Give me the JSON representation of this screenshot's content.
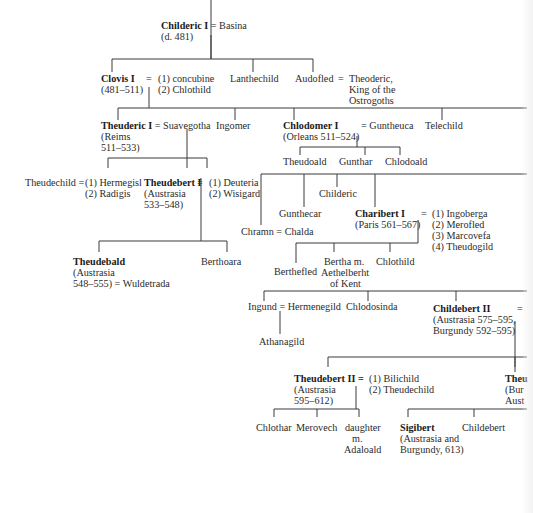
{
  "diagram": {
    "generation_1": {
      "childeric_i": {
        "name": "Childeric I",
        "spouse": "= Basina",
        "dates": "(d. 481)"
      }
    },
    "generation_2": {
      "clovis_i": {
        "name": "Clovis I",
        "dates": "(481–511)",
        "eq": "=",
        "spouses": [
          "(1) concubine",
          "(2) Chlothild"
        ]
      },
      "lanthechild": {
        "name": "Lanthechild"
      },
      "audofled": {
        "name": "Audofled",
        "eq": "=",
        "spouse_lines": [
          "Theoderic,",
          "King of the",
          "Ostrogoths"
        ]
      }
    },
    "generation_3": {
      "theuderic_i": {
        "name": "Theuderic I",
        "spouse": "= Suavegotha",
        "dates": [
          "(Reims",
          "511–533)"
        ]
      },
      "ingomer": {
        "name": "Ingomer"
      },
      "chlodomer_i": {
        "name": "Chlodomer I",
        "spouse": "= Guntheuca",
        "dates": "(Orleans 511–524)"
      },
      "telechild": {
        "name": "Telechild"
      }
    },
    "chlodomer_children": [
      "Theudoald",
      "Gunthar",
      "Chlodoald"
    ],
    "generation_4": {
      "theudechild": {
        "name": "Theudechild =",
        "spouses": [
          "(1) Hermegisl",
          "(2) Radigis"
        ]
      },
      "theudebert_i": {
        "name": "Theudebert I",
        "eq": "=",
        "dates": [
          "(Austrasia",
          "533–548)"
        ],
        "spouses": [
          "(1) Deuteria",
          "(2) Wisigard"
        ]
      },
      "chramn": {
        "name": "Chramn = Chalda"
      },
      "gunthecar": {
        "name": "Gunthecar"
      },
      "childeric": {
        "name": "Childeric"
      },
      "charibert_i": {
        "name": "Charibert I",
        "dates": "(Paris 561–567)",
        "eq": "=",
        "spouses": [
          "(1) Ingoberga",
          "(2) Merofled",
          "(3) Marcovefa",
          "(4) Theudogild"
        ]
      }
    },
    "theudebert_children": {
      "theudebald": {
        "name": "Theudebald",
        "dates": [
          "(Austrasia",
          "548–555) = Wuldetrada"
        ]
      },
      "berthoara": {
        "name": "Berthoara"
      }
    },
    "charibert_children": {
      "berthefled": {
        "name": "Berthefled"
      },
      "bertha": {
        "lines": [
          "Bertha m.",
          "Aethelberht",
          "of Kent"
        ]
      },
      "chlothild": {
        "name": "Chlothild"
      }
    },
    "generation_5": {
      "ingund": {
        "name": "Ingund = Hermenegild"
      },
      "athanagild": {
        "name": "Athanagild"
      },
      "chlodosinda": {
        "name": "Chlodosinda"
      },
      "childebert_ii": {
        "name": "Childebert II",
        "eq": "=",
        "dates": [
          "(Austrasia 575–595,",
          "Burgundy 592–595)"
        ]
      }
    },
    "generation_6": {
      "theudebert_ii": {
        "name": "Theudebert II =",
        "dates": [
          "(Austrasia",
          "595–612)"
        ],
        "spouses": [
          "(1) Bilichild",
          "(2) Theudechild"
        ]
      },
      "theuderic_ii_cut": {
        "name": "Theu",
        "dates": [
          "(Bur",
          "Aust"
        ]
      }
    },
    "generation_7": {
      "chlothar": {
        "name": "Chlothar"
      },
      "merovech": {
        "name": "Merovech"
      },
      "daughter": {
        "lines": [
          "daughter",
          "m.",
          "Adaloald"
        ]
      },
      "sigibert": {
        "name": "Sigibert",
        "dates": [
          "(Austrasia and",
          "Burgundy, 613)"
        ]
      },
      "childebert": {
        "name": "Childebert"
      }
    }
  }
}
